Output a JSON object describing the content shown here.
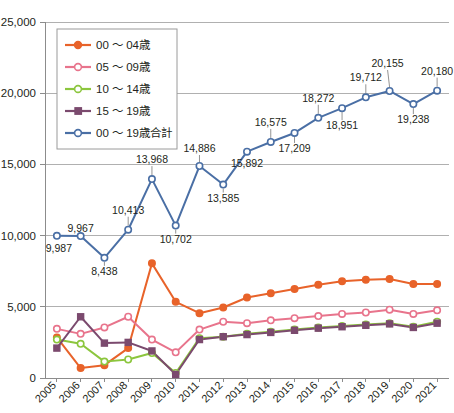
{
  "chart_data": {
    "type": "line",
    "title": "",
    "xlabel": "",
    "ylabel": "",
    "grid": true,
    "legend_position": "top-left",
    "ylim": [
      0,
      25000
    ],
    "ytick_labels": [
      "0",
      "5,000",
      "10,000",
      "15,000",
      "20,000",
      "25,000"
    ],
    "ytick_values": [
      0,
      5000,
      10000,
      15000,
      20000,
      25000
    ],
    "categories": [
      "2005",
      "2006",
      "2007",
      "2008",
      "2009",
      "2010",
      "2011",
      "2012",
      "2013",
      "2014",
      "2015",
      "2016",
      "2017",
      "2018",
      "2019",
      "2020",
      "2021"
    ],
    "series": [
      {
        "name": "00 ～ 04歳",
        "color": "#E8632A",
        "marker": "filled-circle",
        "values": [
          2850,
          700,
          900,
          2100,
          8050,
          5350,
          4550,
          4950,
          5650,
          5950,
          6250,
          6550,
          6800,
          6900,
          6950,
          6600,
          6600
        ]
      },
      {
        "name": "05 ～ 09歳",
        "color": "#E8748C",
        "marker": "open-circle",
        "values": [
          3450,
          3100,
          3550,
          4300,
          2700,
          1800,
          3400,
          3950,
          3850,
          4050,
          4200,
          4350,
          4500,
          4600,
          4800,
          4500,
          4750
        ]
      },
      {
        "name": "10 ～ 14歳",
        "color": "#8CC63E",
        "marker": "open-circle",
        "values": [
          2700,
          2400,
          1150,
          1300,
          1750,
          350,
          2800,
          2900,
          3100,
          3250,
          3400,
          3550,
          3650,
          3750,
          3850,
          3600,
          3950
        ]
      },
      {
        "name": "15 ～ 19歳",
        "color": "#7B4A6E",
        "marker": "filled-square",
        "values": [
          2100,
          4300,
          2450,
          2500,
          1900,
          250,
          2700,
          2900,
          3050,
          3200,
          3350,
          3500,
          3600,
          3700,
          3800,
          3550,
          3850
        ]
      },
      {
        "name": "00 ～ 19歳合計",
        "color": "#4A6FA5",
        "marker": "open-circle",
        "values": [
          9987,
          9967,
          8438,
          10413,
          13968,
          10702,
          14886,
          13585,
          15892,
          16575,
          17209,
          18272,
          18951,
          19712,
          20155,
          19238,
          20180
        ],
        "data_labels": [
          "9,987",
          "9,967",
          "8,438",
          "10,413",
          "13,968",
          "10,702",
          "14,886",
          "13,585",
          "15,892",
          "16,575",
          "17,209",
          "18,272",
          "18,951",
          "19,712",
          "20,155",
          "19,238",
          "20,180"
        ]
      }
    ]
  }
}
